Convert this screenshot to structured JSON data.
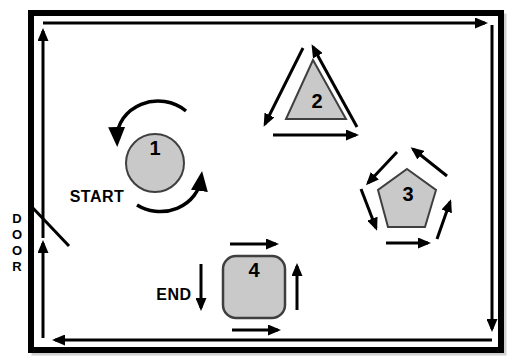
{
  "diagram": {
    "type": "room-course-map",
    "labels": {
      "start": "START",
      "end": "END",
      "door": "DOOR"
    },
    "stations": [
      {
        "number": "1",
        "shape": "circle",
        "arrows": "two curved arrows circling counterclockwise"
      },
      {
        "number": "2",
        "shape": "triangle",
        "arrows": "bottom right, right edge up to apex, left edge down (counterclockwise circuit)"
      },
      {
        "number": "3",
        "shape": "pentagon",
        "arrows": "five arrows circling counterclockwise"
      },
      {
        "number": "4",
        "shape": "rounded-square",
        "arrows": "top right, right side up, bottom right; down arrow at left beside END"
      }
    ],
    "perimeter": {
      "direction": "clockwise",
      "description": "arrowed path just inside the wall: up the left side (extra arrow after the door), right across the top, down the right side, left across the bottom"
    },
    "door": {
      "position": "left-wall",
      "swing": "diagonal leaf into the room"
    },
    "colors": {
      "background": "#ffffff",
      "wall": "#000000",
      "line": "#000000",
      "shape_fill": "#c9c9c9",
      "shape_stroke": "#3f3f3f",
      "text": "#000000"
    }
  }
}
